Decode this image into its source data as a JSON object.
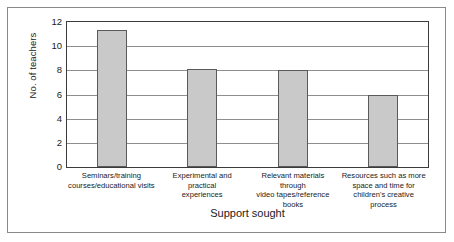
{
  "chart_data": {
    "type": "bar",
    "title": "",
    "xlabel": "Support sought",
    "ylabel": "No. of teachers",
    "categories": [
      "Seminars/training courses/educational visits",
      "Experimental and practical experiences",
      "Relevant materials through video tapes/reference books",
      "Resources such as more space and time for children's creative process"
    ],
    "category_lines": [
      [
        "Seminars/training",
        "courses/educational visits"
      ],
      [
        "Experimental and practical",
        "experiences"
      ],
      [
        "Relevant materials through",
        "video tapes/reference books"
      ],
      [
        "Resources such as more",
        "space and time for",
        "children's creative process"
      ]
    ],
    "values": [
      11.3,
      8.1,
      8.0,
      6.0
    ],
    "ylim": [
      0,
      12
    ],
    "yticks": [
      12,
      10,
      8,
      6,
      4,
      2,
      0
    ],
    "ytick_labels": [
      "12",
      "10",
      "8",
      "6",
      "4",
      "2",
      "0"
    ],
    "grid": true,
    "legend": false,
    "bar_fill_color": "#c9c9c9",
    "bar_border_color": "#5a5a5a",
    "gridline_color": "#8e8e8e",
    "axis_color": "#3b3b3b",
    "frame_color": "#8a8a8a"
  }
}
